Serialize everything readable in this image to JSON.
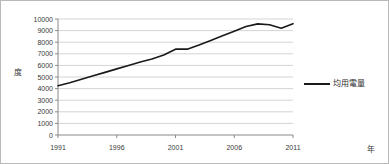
{
  "chart_data": {
    "type": "line",
    "title": "",
    "subtitle": "",
    "xlabel": "年",
    "ylabel": "度",
    "xlim": [
      1991,
      2011
    ],
    "ylim": [
      0,
      10000
    ],
    "grid": true,
    "grid_axis": "y",
    "legend_position": "right",
    "y_ticks": [
      0,
      1000,
      2000,
      3000,
      4000,
      5000,
      6000,
      7000,
      8000,
      9000,
      10000
    ],
    "y_tick_labels": [
      "0",
      "1000",
      "2000",
      "3000",
      "4000",
      "5000",
      "6000",
      "7000",
      "8000",
      "9000",
      "10000"
    ],
    "x_ticks": [
      1991,
      1996,
      2001,
      2006,
      2011
    ],
    "x_tick_labels": [
      "1991",
      "1996",
      "2001",
      "2006",
      "2011"
    ],
    "series": [
      {
        "name": "均用電量",
        "color": "#1a1a1a",
        "x": [
          1991,
          1992,
          1993,
          1994,
          1995,
          1996,
          1997,
          1998,
          1999,
          2000,
          2001,
          2002,
          2003,
          2004,
          2005,
          2006,
          2007,
          2008,
          2009,
          2010,
          2011
        ],
        "values": [
          4250,
          4500,
          4800,
          5100,
          5400,
          5700,
          6000,
          6300,
          6550,
          6900,
          7400,
          7400,
          7750,
          8150,
          8550,
          8950,
          9350,
          9580,
          9500,
          9200,
          9600
        ]
      }
    ]
  },
  "legend": {
    "label": "均用電量",
    "color": "#1a1a1a"
  },
  "axes": {
    "y_title": "度",
    "x_title": "年"
  }
}
